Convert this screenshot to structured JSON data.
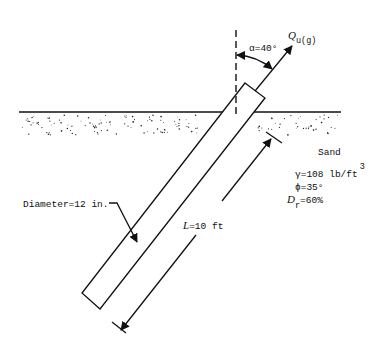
{
  "diagram": {
    "load": {
      "symbol": "Q",
      "subscript": "u(g)"
    },
    "angle_label": "α=40°",
    "length_label": {
      "symbol": "L",
      "value": "=10 ft"
    },
    "diameter_label": "Diameter=12 in.",
    "soil": {
      "name": "Sand",
      "unit_weight": "γ=108 lb/ft",
      "unit_weight_exponent": "3",
      "friction_angle": "ϕ=35°",
      "relative_density_symbol": "D",
      "relative_density_subscript": "r",
      "relative_density_value": "=60%"
    },
    "colors": {
      "ink": "#111111",
      "background": "#ffffff"
    }
  }
}
